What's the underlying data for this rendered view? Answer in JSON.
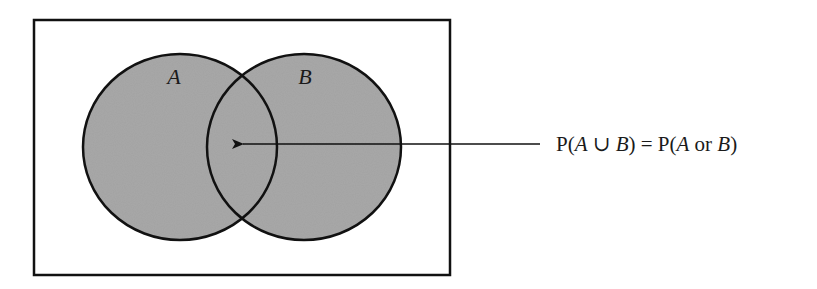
{
  "diagram": {
    "type": "venn",
    "colors": {
      "fill": "#a9a9a9",
      "stroke": "#111111",
      "background": "#ffffff"
    },
    "universe": {
      "x": 34,
      "y": 20,
      "width": 416,
      "height": 255
    },
    "sets": [
      {
        "name": "A",
        "label": "A",
        "cx": 180,
        "cy": 147,
        "rx": 97,
        "ry": 93,
        "label_x": 174,
        "label_y": 84
      },
      {
        "name": "B",
        "label": "B",
        "cx": 304,
        "cy": 147,
        "rx": 97,
        "ry": 93,
        "label_x": 305,
        "label_y": 84
      }
    ],
    "arrow": {
      "x1": 540,
      "y1": 144,
      "x2": 243,
      "y2": 144
    },
    "annotation": {
      "parts": [
        {
          "text": "P(",
          "italic": false
        },
        {
          "text": "A",
          "italic": true
        },
        {
          "text": " ∪ ",
          "italic": false
        },
        {
          "text": "B",
          "italic": true
        },
        {
          "text": ") = P(",
          "italic": false
        },
        {
          "text": "A",
          "italic": true
        },
        {
          "text": " or ",
          "italic": false
        },
        {
          "text": "B",
          "italic": true
        },
        {
          "text": ")",
          "italic": false
        }
      ],
      "full_text": "P(A ∪ B) = P(A or B)",
      "x": 556,
      "y": 151
    }
  }
}
